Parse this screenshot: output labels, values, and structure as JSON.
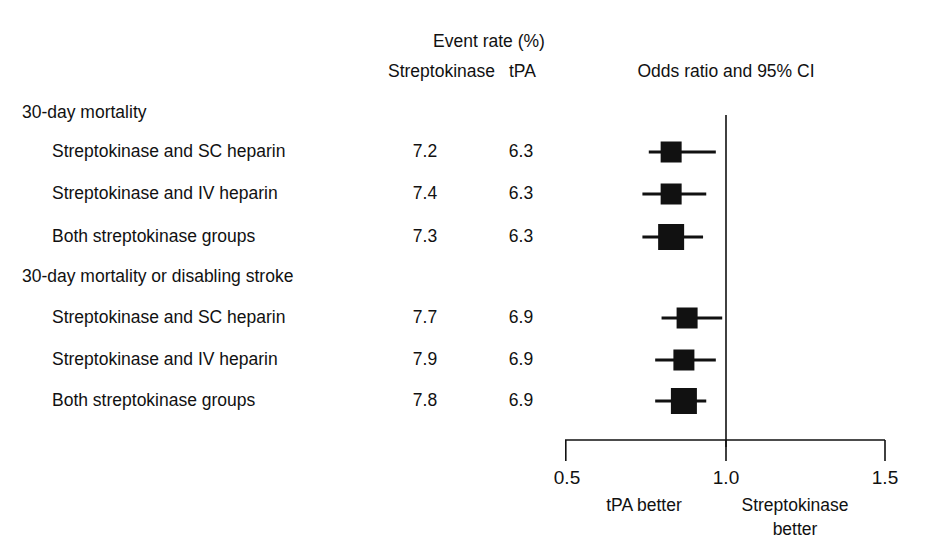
{
  "figure": {
    "type": "forest-plot",
    "background": "#ffffff",
    "ink": "#111111"
  },
  "header": {
    "event_rate_title": "Event rate (%)",
    "col_streptokinase": "Streptokinase",
    "col_tpa": "tPA",
    "plot_title": "Odds ratio and 95% CI"
  },
  "axis": {
    "ticks": [
      "0.5",
      "1.0",
      "1.5"
    ],
    "tick_values": [
      0.5,
      1.0,
      1.5
    ],
    "min": 0.5,
    "max": 1.5,
    "reference_line": 1.0,
    "left_footnote": "tPA better",
    "right_footnote_line1": "Streptokinase",
    "right_footnote_line2": "better"
  },
  "chart_data": {
    "type": "forest",
    "title": "Odds ratio and 95% CI",
    "xlabel": "Odds ratio",
    "ylabel": "",
    "xlim": [
      0.5,
      1.5
    ],
    "xticks": [
      0.5,
      1.0,
      1.5
    ],
    "grid": false,
    "reference_line": 1.0,
    "legend": "none",
    "columns": [
      "Event rate (%) Streptokinase",
      "Event rate (%) tPA",
      "Odds ratio and 95% CI"
    ],
    "groups": [
      {
        "label": "30-day mortality",
        "rows": [
          {
            "label": "Streptokinase and SC heparin",
            "streptokinase": "7.2",
            "tpa": "6.3",
            "or": 0.83,
            "ci_low": 0.76,
            "ci_high": 0.97,
            "pooled": false
          },
          {
            "label": "Streptokinase and IV heparin",
            "streptokinase": "7.4",
            "tpa": "6.3",
            "or": 0.83,
            "ci_low": 0.74,
            "ci_high": 0.94,
            "pooled": false
          },
          {
            "label": "Both streptokinase groups",
            "streptokinase": "7.3",
            "tpa": "6.3",
            "or": 0.83,
            "ci_low": 0.74,
            "ci_high": 0.93,
            "pooled": true
          }
        ]
      },
      {
        "label": "30-day mortality or disabling stroke",
        "rows": [
          {
            "label": "Streptokinase and SC heparin",
            "streptokinase": "7.7",
            "tpa": "6.9",
            "or": 0.88,
            "ci_low": 0.8,
            "ci_high": 0.99,
            "pooled": false
          },
          {
            "label": "Streptokinase and IV heparin",
            "streptokinase": "7.9",
            "tpa": "6.9",
            "or": 0.87,
            "ci_low": 0.78,
            "ci_high": 0.97,
            "pooled": false
          },
          {
            "label": "Both streptokinase groups",
            "streptokinase": "7.8",
            "tpa": "6.9",
            "or": 0.87,
            "ci_low": 0.78,
            "ci_high": 0.94,
            "pooled": true
          }
        ]
      }
    ]
  }
}
